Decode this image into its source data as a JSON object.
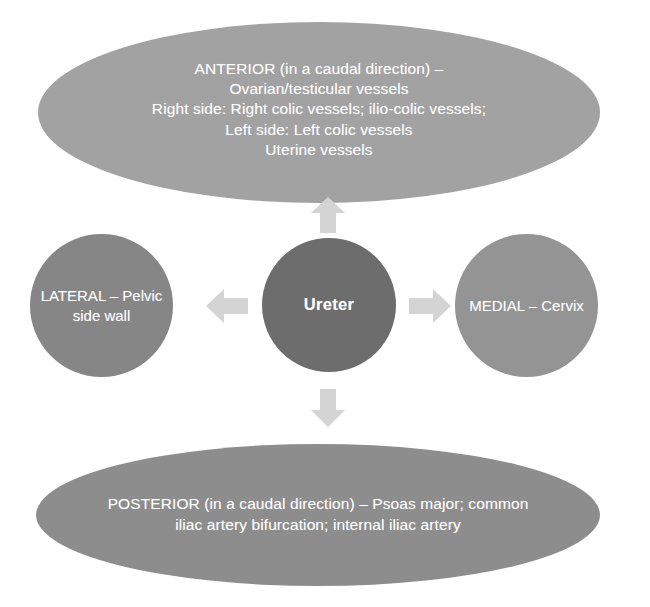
{
  "diagram": {
    "center": {
      "id": "ureter",
      "label": "Ureter",
      "color": "#6d6d6d"
    },
    "anterior": {
      "id": "anterior",
      "label": "ANTERIOR (in a caudal direction) –\nOvarian/testicular vessels\nRight side: Right colic vessels; ilio-colic vessels;\nLeft side: Left colic vessels\nUterine vessels",
      "color": "#a2a2a2"
    },
    "posterior": {
      "id": "posterior",
      "label": "POSTERIOR (in a caudal direction) – Psoas major; common iliac artery bifurcation; internal iliac artery",
      "color": "#8d8d8d"
    },
    "lateral": {
      "id": "lateral",
      "label": "LATERAL – Pelvic side wall",
      "color": "#868686"
    },
    "medial": {
      "id": "medial",
      "label": "MEDIAL – Cervix",
      "color": "#949494"
    },
    "arrows": {
      "up": "arrow-up-icon",
      "down": "arrow-down-icon",
      "left": "arrow-left-icon",
      "right": "arrow-right-icon",
      "color": "#d2d2d2"
    },
    "background": "#ffffff",
    "text_color": "#ffffff"
  }
}
